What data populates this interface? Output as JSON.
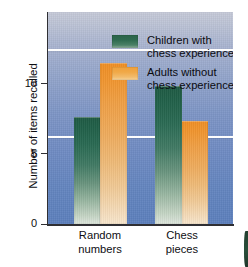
{
  "chart_data": {
    "type": "bar",
    "title": "",
    "xlabel": "",
    "ylabel": "Number of items recalled",
    "ylim": [
      0,
      12.1
    ],
    "yticks": [
      0,
      5,
      10
    ],
    "ytick_labels": [
      "0",
      "5",
      "10"
    ],
    "grid": "horizontal gridlines at y = 5 and y = 10, white",
    "legend_position": "upper-left inside plot area",
    "categories": [
      "Random numbers",
      "Chess pieces"
    ],
    "category_lines": [
      [
        "Random",
        "numbers"
      ],
      [
        "Chess",
        "pieces"
      ]
    ],
    "series": [
      {
        "name": "Children with chess experience",
        "name_lines": [
          "Children with",
          "chess experience"
        ],
        "color": "#2a6349",
        "values": [
          6.1,
          7.9
        ]
      },
      {
        "name": "Adults without chess experience",
        "name_lines": [
          "Adults without",
          "chess experience"
        ],
        "color": "#f0a03a",
        "values": [
          9.2,
          5.9
        ]
      }
    ]
  },
  "colors": {
    "background_top": "#c6cad8",
    "background_bottom": "#5c80bd",
    "gridline": "#fdfdfd",
    "axis": "#2f2f33",
    "text": "#0e0e12",
    "series_green": "#2a6349",
    "series_orange": "#f0a03a"
  }
}
